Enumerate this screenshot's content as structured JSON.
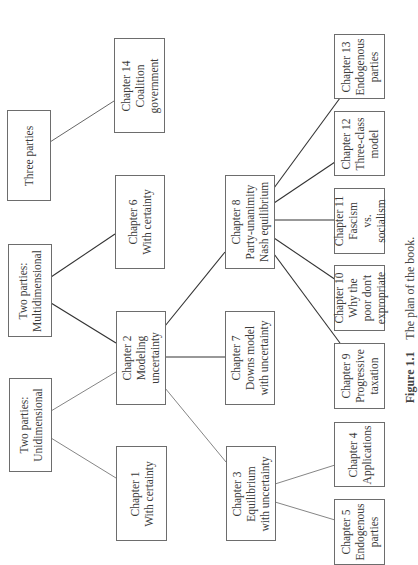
{
  "figure": {
    "caption_label": "Figure 1.1",
    "caption_text": "The plan of the book."
  },
  "nodes": {
    "three_parties": {
      "label": "Three parties"
    },
    "ch14": {
      "label": "Chapter 14\nCoalition\ngovernment"
    },
    "two_multi": {
      "label": "Two parties:\nMultidimensional"
    },
    "ch6": {
      "label": "Chapter 6\nWith certainty"
    },
    "two_uni": {
      "label": "Two parties:\nUnidimensional"
    },
    "ch2": {
      "label": "Chapter 2\nModeling\nuncertainty"
    },
    "ch1": {
      "label": "Chapter 1\nWith certainty"
    },
    "ch3": {
      "label": "Chapter 3\nEquilibrium\nwith uncertainty"
    },
    "ch7": {
      "label": "Chapter 7\nDowns model\nwith uncertainty"
    },
    "ch8": {
      "label": "Chapter 8\nParty-unanimity\nNash equilibrium"
    },
    "ch4": {
      "label": "Chapter 4\nApplications"
    },
    "ch5": {
      "label": "Chapter 5\nEndogenous\nparties"
    },
    "ch9": {
      "label": "Chapter 9\nProgressive\ntaxation"
    },
    "ch10": {
      "label": "Chapter 10\nWhy the\npoor don't\nexpropriate"
    },
    "ch11": {
      "label": "Chapter 11\nFascism\nvs.\nsocialism"
    },
    "ch12": {
      "label": "Chapter 12\nThree-class\nmodel"
    },
    "ch13": {
      "label": "Chapter 13\nEndogenous\nparties"
    }
  },
  "edges": [
    [
      "three_parties",
      "ch14"
    ],
    [
      "two_multi",
      "ch6"
    ],
    [
      "two_multi",
      "ch2"
    ],
    [
      "two_uni",
      "ch2"
    ],
    [
      "two_uni",
      "ch1"
    ],
    [
      "ch2",
      "ch8"
    ],
    [
      "ch2",
      "ch7"
    ],
    [
      "ch2",
      "ch3"
    ],
    [
      "ch3",
      "ch4"
    ],
    [
      "ch3",
      "ch5"
    ],
    [
      "ch8",
      "ch9"
    ],
    [
      "ch8",
      "ch10"
    ],
    [
      "ch8",
      "ch11"
    ],
    [
      "ch8",
      "ch12"
    ],
    [
      "ch8",
      "ch13"
    ]
  ],
  "colors": {
    "border": "#6d6d6d",
    "line": "#333333",
    "text": "#3a3a3a"
  }
}
